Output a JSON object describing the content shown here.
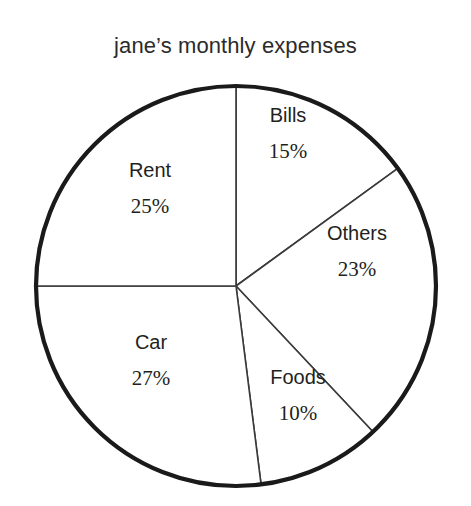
{
  "chart_data": {
    "type": "pie",
    "title": "jane’s monthly expenses",
    "xlabel": "",
    "ylabel": "",
    "legend": "none",
    "grid": false,
    "start_angle_deg": 0,
    "direction": "clockwise",
    "categories": [
      "Bills",
      "Others",
      "Foods",
      "Car",
      "Rent"
    ],
    "values": [
      15,
      23,
      10,
      27,
      25
    ],
    "value_suffix": "%",
    "slices": [
      {
        "label": "Bills",
        "value": 15,
        "value_text": "15%",
        "start_deg": 0,
        "end_deg": 54,
        "fill": "#ffffff"
      },
      {
        "label": "Others",
        "value": 23,
        "value_text": "23%",
        "start_deg": 54,
        "end_deg": 136.8,
        "fill": "#ffffff"
      },
      {
        "label": "Foods",
        "value": 10,
        "value_text": "10%",
        "start_deg": 136.8,
        "end_deg": 172.8,
        "fill": "#ffffff"
      },
      {
        "label": "Car",
        "value": 27,
        "value_text": "27%",
        "start_deg": 172.8,
        "end_deg": 270,
        "fill": "#ffffff"
      },
      {
        "label": "Rent",
        "value": 25,
        "value_text": "25%",
        "start_deg": 270,
        "end_deg": 360,
        "fill": "#ffffff"
      }
    ],
    "total": 100,
    "geometry": {
      "center_x": 236,
      "center_y": 286,
      "radius": 200
    },
    "colors": {
      "background": "#ffffff",
      "outline": "#1a1a1a",
      "divider": "#3a3a3a",
      "text": "#231f20"
    }
  }
}
